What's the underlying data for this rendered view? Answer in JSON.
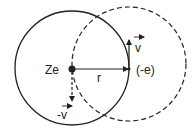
{
  "diagram": {
    "labels": {
      "nucleus": "Ze",
      "electron": "(-e)",
      "radius": "r",
      "velocity": "v",
      "neg_velocity": "-v"
    },
    "colors": {
      "stroke": "#222222",
      "background": "#ffffff"
    }
  }
}
